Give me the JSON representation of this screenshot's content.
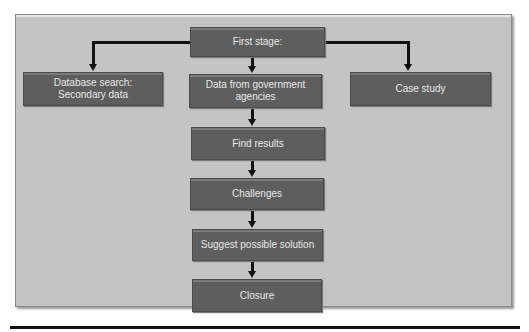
{
  "title_partial": "…ntity …ly…… in  …ging …",
  "diagram": {
    "nodes": {
      "first_stage": "First stage:",
      "database_search": "Database search: Secondary data",
      "government_data": "Data from government agencies",
      "case_study": "Case study",
      "find_results": "Find results",
      "challenges": "Challenges",
      "suggest_solution": "Suggest possible solution",
      "closure": "Closure"
    },
    "colors": {
      "background": "#c4c4c4",
      "node_fill": "#5e5e5e",
      "node_text": "#e8e8e8",
      "connector": "#111111"
    }
  }
}
